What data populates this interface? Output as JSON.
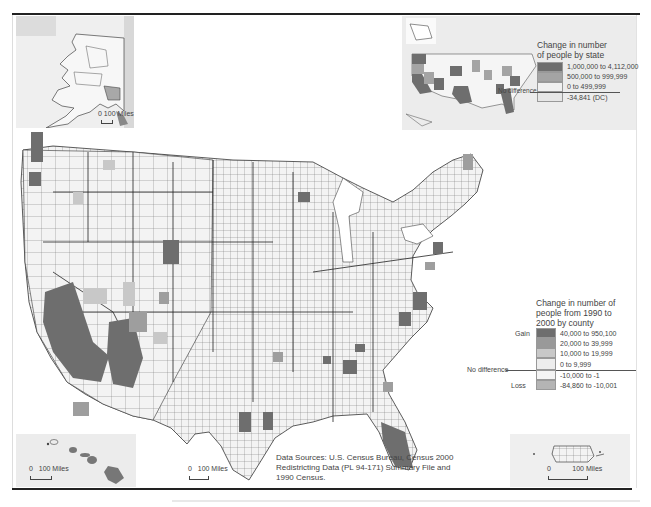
{
  "map": {
    "title": "Population change 1990 to 2000",
    "county_legend": {
      "title": "Change in number of people from 1990 to 2000 by county",
      "title_lines": [
        "Change in number of",
        "people from 1990 to",
        "2000 by county"
      ],
      "gain_label": "Gain",
      "loss_label": "Loss",
      "no_difference_label": "No difference",
      "classes": [
        {
          "label": "40,000 to 950,100",
          "color": "#6e6e6e"
        },
        {
          "label": "20,000 to 39,999",
          "color": "#999999"
        },
        {
          "label": "10,000 to 19,999",
          "color": "#c8c8c8"
        },
        {
          "label": "0 to 9,999",
          "color": "#ededed"
        },
        {
          "label": "-10,000 to -1",
          "color": "#f4f4f4"
        },
        {
          "label": "-84,860 to -10,001",
          "color": "#b4b4b4"
        }
      ]
    },
    "state_legend": {
      "title": "Change in number of people by state",
      "title_lines": [
        "Change in number",
        "of people by state"
      ],
      "no_difference_label": "No difference",
      "classes": [
        {
          "label": "1,000,000 to 4,112,000",
          "color": "#6e6e6e"
        },
        {
          "label": "500,000 to 999,999",
          "color": "#a4a4a4"
        },
        {
          "label": "0 to 499,999",
          "color": "#f0f0f0"
        },
        {
          "label": "-34,841 (DC)",
          "color": "#e6e6e6"
        }
      ]
    },
    "insets": {
      "alaska": {
        "scale_zero": "0",
        "scale_label": "100 Miles"
      },
      "hawaii": {
        "scale_zero": "0",
        "scale_label": "100 Miles"
      },
      "puerto_rico": {
        "scale_zero": "0",
        "scale_label": "100 Miles"
      },
      "main": {
        "scale_zero": "0",
        "scale_label": "100 Miles"
      }
    },
    "source": {
      "lines": [
        "Data Sources: U.S. Census Bureau, Census 2000",
        "Redistricting Data (PL 94-171) Summary File and",
        "1990 Census."
      ]
    }
  }
}
